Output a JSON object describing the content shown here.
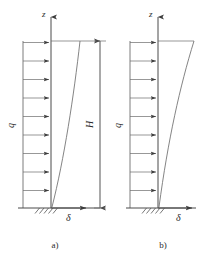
{
  "figure": {
    "title_visible": false,
    "background_color": "#ffffff",
    "line_color": "#5a5a5a",
    "text_color": "#2b2b2b",
    "panels": [
      {
        "id": "a",
        "caption": "a)",
        "vertical_axis_label": "z",
        "horizontal_axis_label": "δ",
        "load_label": "q",
        "load_arrow_count": 9,
        "curve_description": "near-straight inclined deflection profile, fixed at base",
        "support_type": "fixed-hatched-base"
      },
      {
        "id": "b",
        "caption": "b)",
        "vertical_axis_label": "z",
        "horizontal_axis_label": "δ",
        "load_label": "q",
        "load_arrow_count": 9,
        "curve_description": "concave deflection profile bulging outward near the top, fixed at base",
        "support_type": "fixed-hatched-base"
      }
    ],
    "dimension": {
      "label": "H",
      "orientation": "vertical",
      "arrow_ends": "both"
    }
  }
}
